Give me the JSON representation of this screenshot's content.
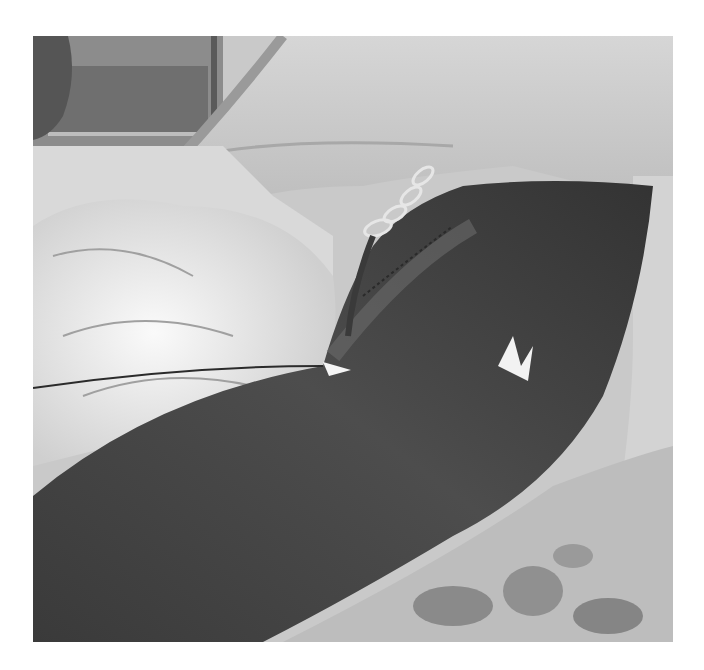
{
  "image": {
    "kind": "grayscale clinical photograph",
    "description": "Patient limb (thigh/arm) draped on surgical sheets, with a drain tube and fixation clip near the upper region, plastic wrapping on the left, patterned sheet at bottom right",
    "colors": {
      "background": "#ffffff",
      "skin": "#4a4a4a",
      "skin_dark": "#333333",
      "drape_light": "#dcdcdc",
      "drape_mid": "#b8b8b8",
      "plastic": "#f2f2f2",
      "wall": "#7a7a7a",
      "pattern": "#8a8a8a"
    },
    "bounds": {
      "x": 33,
      "y": 36,
      "width": 640,
      "height": 606
    }
  }
}
